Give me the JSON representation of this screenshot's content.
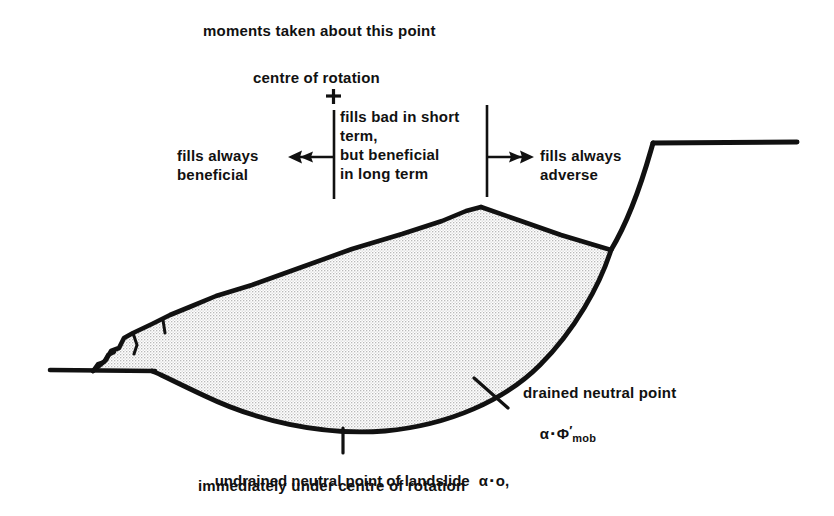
{
  "figure": {
    "title_note": "moments taken about this point",
    "centre_label": "centre of rotation",
    "centre_marker": "+",
    "zones": {
      "left": "fills always\nbeneficial",
      "middle": "fills bad in short\nterm,\nbut beneficial\nin long term",
      "right": "fills always\nadverse"
    },
    "annotations": {
      "drained_point_label": "drained neutral point",
      "drained_point_alpha": "α",
      "drained_point_equals": "▪",
      "drained_point_phi": "Φ",
      "drained_point_prime": "′",
      "drained_point_sub": "mob",
      "undrained_line1": "undrained neutral point of landslide",
      "undrained_alpha": "α",
      "undrained_equals": "▪",
      "undrained_value": "o,",
      "undrained_line2": "immediately under centre of rotation"
    },
    "colors": {
      "ink": "#111111",
      "fill_hatch": "#9a9a9a",
      "background": "#ffffff"
    },
    "geometry": {
      "slide_mass_note": "rotational landslide mass with crosshatch fill",
      "centre_of_rotation": [
        333,
        96
      ],
      "undrained_neutral_point": [
        343,
        432
      ],
      "drained_neutral_point": [
        492,
        392
      ]
    }
  }
}
